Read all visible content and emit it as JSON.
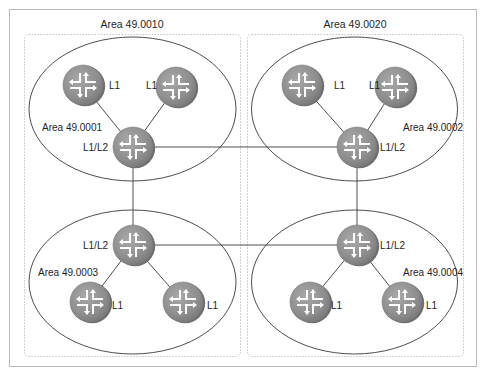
{
  "diagram": {
    "type": "IS-IS multi-area topology",
    "colors": {
      "frame": "#b9b9b9",
      "dotted_box": "#c4c4c4",
      "ellipse": "#3a3a3a",
      "link": "#3a3a3a",
      "router_fill": "#8f8f8f",
      "router_edge": "#6a6a6a",
      "router_glyph": "#ffffff",
      "text": "#1e1e1e"
    },
    "outer_areas": [
      {
        "id": "left",
        "label": "Area 49.0010"
      },
      {
        "id": "right",
        "label": "Area 49.0020"
      }
    ],
    "areas": [
      {
        "id": "area1",
        "label": "Area 49.0001",
        "routers": [
          {
            "id": "r1a",
            "label": "L1",
            "role": "L1"
          },
          {
            "id": "r1b",
            "label": "L1",
            "role": "L1"
          },
          {
            "id": "r1h",
            "label": "L1/L2",
            "role": "L1/L2"
          }
        ]
      },
      {
        "id": "area2",
        "label": "Area 49.0002",
        "routers": [
          {
            "id": "r2a",
            "label": "L1",
            "role": "L1"
          },
          {
            "id": "r2b",
            "label": "L1",
            "role": "L1"
          },
          {
            "id": "r2h",
            "label": "L1/L2",
            "role": "L1/L2"
          }
        ]
      },
      {
        "id": "area3",
        "label": "Area 49.0003",
        "routers": [
          {
            "id": "r3h",
            "label": "L1/L2",
            "role": "L1/L2"
          },
          {
            "id": "r3a",
            "label": "L1",
            "role": "L1"
          },
          {
            "id": "r3b",
            "label": "L1",
            "role": "L1"
          }
        ]
      },
      {
        "id": "area4",
        "label": "Area 49.0004",
        "routers": [
          {
            "id": "r4h",
            "label": "L1/L2",
            "role": "L1/L2"
          },
          {
            "id": "r4a",
            "label": "L1",
            "role": "L1"
          },
          {
            "id": "r4b",
            "label": "L1",
            "role": "L1"
          }
        ]
      }
    ],
    "links": [
      [
        "r1a",
        "r1h"
      ],
      [
        "r1b",
        "r1h"
      ],
      [
        "r2a",
        "r2h"
      ],
      [
        "r2b",
        "r2h"
      ],
      [
        "r3h",
        "r3a"
      ],
      [
        "r3h",
        "r3b"
      ],
      [
        "r4h",
        "r4a"
      ],
      [
        "r4h",
        "r4b"
      ],
      [
        "r1h",
        "r2h"
      ],
      [
        "r1h",
        "r3h"
      ],
      [
        "r2h",
        "r4h"
      ],
      [
        "r3h",
        "r4h"
      ]
    ]
  }
}
